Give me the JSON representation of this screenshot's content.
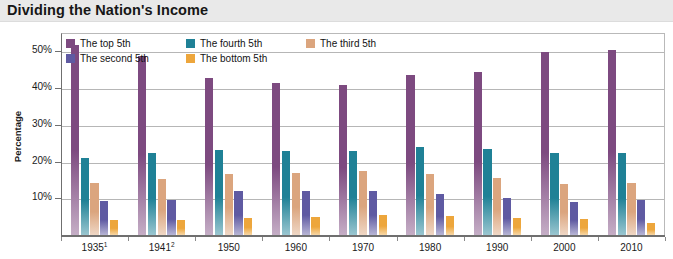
{
  "header": {
    "title": "Dividing the Nation's Income"
  },
  "chart_data": {
    "type": "bar",
    "title": "Dividing the Nation's Income",
    "xlabel": "",
    "ylabel": "Percentage",
    "ylim": [
      0,
      55
    ],
    "yticks": [
      10,
      20,
      30,
      40,
      50
    ],
    "ytick_labels": [
      "10%",
      "20%",
      "30%",
      "40%",
      "50%"
    ],
    "grid": true,
    "legend_position": "top-left inside plot",
    "categories": [
      "1935¹",
      "1941²",
      "1950",
      "1960",
      "1970",
      "1980",
      "1990",
      "2000",
      "2010"
    ],
    "category_plain": [
      "1935",
      "1941",
      "1950",
      "1960",
      "1970",
      "1980",
      "1990",
      "2000",
      "2010"
    ],
    "series": [
      {
        "name": "The top 5th",
        "color": "#7d4a80",
        "values": [
          51.7,
          48.8,
          42.7,
          41.3,
          40.9,
          43.5,
          44.3,
          49.8,
          50.3
        ]
      },
      {
        "name": "The fourth 5th",
        "color": "#1f8196",
        "values": [
          20.9,
          22.3,
          23.1,
          22.8,
          23.0,
          23.9,
          23.3,
          22.4,
          22.2
        ]
      },
      {
        "name": "The third 5th",
        "color": "#dba57e",
        "values": [
          14.1,
          15.3,
          16.5,
          17.0,
          17.4,
          16.5,
          15.6,
          14.0,
          14.1
        ]
      },
      {
        "name": "The second 5th",
        "color": "#5f5aa2",
        "values": [
          9.2,
          9.5,
          11.9,
          12.0,
          12.1,
          11.2,
          10.0,
          9.0,
          9.4
        ]
      },
      {
        "name": "The bottom 5th",
        "color": "#eda63c",
        "values": [
          4.1,
          4.1,
          4.5,
          4.8,
          5.4,
          5.1,
          4.6,
          4.3,
          3.3
        ]
      }
    ],
    "footnote_markers": [
      "1",
      "2"
    ]
  },
  "legend": {
    "items": [
      {
        "label": "The top 5th",
        "color": "#7d4a80"
      },
      {
        "label": "The fourth 5th",
        "color": "#1f8196"
      },
      {
        "label": "The third 5th",
        "color": "#dba57e"
      },
      {
        "label": "The second 5th",
        "color": "#5f5aa2"
      },
      {
        "label": "The bottom 5th",
        "color": "#eda63c"
      }
    ]
  },
  "axis": {
    "y_title": "Percentage",
    "y_tick_labels": [
      "50%",
      "40%",
      "30%",
      "20%",
      "10%"
    ],
    "x_tick_labels": [
      "1935¹",
      "1941²",
      "1950",
      "1960",
      "1970",
      "1980",
      "1990",
      "2000",
      "2010"
    ]
  }
}
